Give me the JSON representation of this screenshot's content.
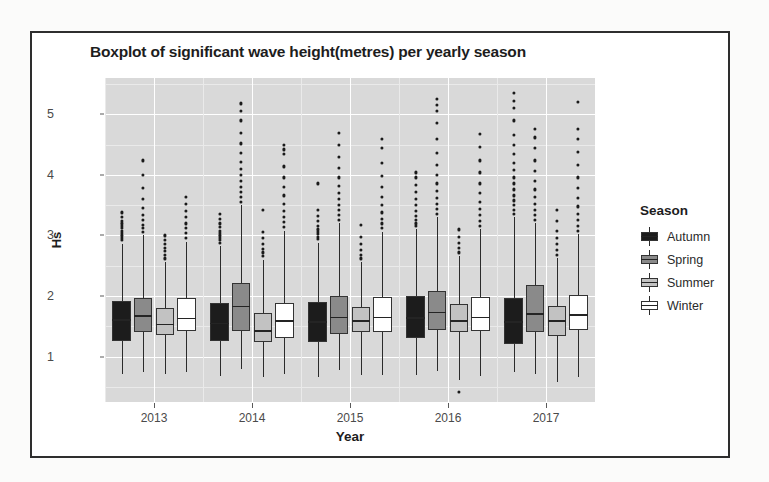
{
  "chart_data": {
    "type": "box",
    "title": "Boxplot of significant wave height(metres) per yearly season",
    "xlabel": "Year",
    "ylabel": "Hs",
    "categories": [
      "2013",
      "2014",
      "2015",
      "2016",
      "2017"
    ],
    "ylim": [
      0.25,
      5.6
    ],
    "yticks": [
      1,
      2,
      3,
      4,
      5
    ],
    "ytick_labels": [
      "1",
      "2",
      "3",
      "4",
      "5"
    ],
    "grid": true,
    "legend": {
      "title": "Season",
      "position": "right",
      "entries": [
        {
          "label": "Autumn",
          "color": "#1c1c1c"
        },
        {
          "label": "Spring",
          "color": "#8a8a8a"
        },
        {
          "label": "Summer",
          "color": "#c2c2c2"
        },
        {
          "label": "Winter",
          "color": "#ffffff"
        }
      ]
    },
    "series": [
      {
        "name": "Autumn",
        "color": "#1c1c1c",
        "boxes": [
          {
            "category": "2013",
            "lower_whisker": 0.72,
            "q1": 1.25,
            "median": 1.62,
            "q3": 1.92,
            "upper_whisker": 2.86,
            "outliers": [
              2.92,
              2.96,
              3.0,
              3.04,
              3.08,
              3.12,
              3.16,
              3.2,
              3.24,
              3.3,
              3.38
            ]
          },
          {
            "category": "2014",
            "lower_whisker": 0.68,
            "q1": 1.26,
            "median": 1.56,
            "q3": 1.88,
            "upper_whisker": 2.82,
            "outliers": [
              2.88,
              2.92,
              2.96,
              3.0,
              3.04,
              3.08,
              3.14,
              3.2,
              3.28,
              3.36
            ]
          },
          {
            "category": "2015",
            "lower_whisker": 0.66,
            "q1": 1.24,
            "median": 1.58,
            "q3": 1.9,
            "upper_whisker": 2.88,
            "outliers": [
              2.94,
              2.98,
              3.02,
              3.06,
              3.1,
              3.16,
              3.24,
              3.32,
              3.42,
              3.86
            ]
          },
          {
            "category": "2016",
            "lower_whisker": 0.7,
            "q1": 1.3,
            "median": 1.65,
            "q3": 2.0,
            "upper_whisker": 3.1,
            "outliers": [
              3.16,
              3.2,
              3.26,
              3.32,
              3.4,
              3.5,
              3.6,
              3.72,
              3.84,
              3.96,
              4.04
            ]
          },
          {
            "category": "2017",
            "lower_whisker": 0.74,
            "q1": 1.2,
            "median": 1.58,
            "q3": 1.96,
            "upper_whisker": 3.3,
            "outliers": [
              3.36,
              3.42,
              3.5,
              3.58,
              3.66,
              3.76,
              3.86,
              3.96,
              4.08,
              4.2,
              4.34,
              4.5,
              4.66,
              4.9,
              5.1,
              5.22,
              5.36
            ]
          }
        ]
      },
      {
        "name": "Spring",
        "color": "#8a8a8a",
        "boxes": [
          {
            "category": "2013",
            "lower_whisker": 0.74,
            "q1": 1.4,
            "median": 1.68,
            "q3": 1.96,
            "upper_whisker": 3.0,
            "outliers": [
              3.06,
              3.12,
              3.18,
              3.26,
              3.34,
              3.46,
              3.6,
              3.78,
              4.0,
              4.24
            ]
          },
          {
            "category": "2014",
            "lower_whisker": 0.8,
            "q1": 1.42,
            "median": 1.84,
            "q3": 2.22,
            "upper_whisker": 3.5,
            "outliers": [
              3.56,
              3.64,
              3.72,
              3.8,
              3.9,
              4.0,
              4.1,
              4.22,
              4.36,
              4.52,
              4.7,
              4.9,
              5.06,
              5.18
            ]
          },
          {
            "category": "2015",
            "lower_whisker": 0.78,
            "q1": 1.38,
            "median": 1.66,
            "q3": 2.0,
            "upper_whisker": 3.2,
            "outliers": [
              3.26,
              3.34,
              3.42,
              3.5,
              3.6,
              3.7,
              3.82,
              3.96,
              4.12,
              4.3,
              4.5,
              4.7
            ]
          },
          {
            "category": "2016",
            "lower_whisker": 0.76,
            "q1": 1.44,
            "median": 1.74,
            "q3": 2.08,
            "upper_whisker": 3.3,
            "outliers": [
              3.36,
              3.44,
              3.52,
              3.62,
              3.74,
              3.86,
              4.0,
              4.16,
              4.36,
              4.6,
              4.86,
              5.06,
              5.16,
              5.26
            ]
          },
          {
            "category": "2017",
            "lower_whisker": 0.72,
            "q1": 1.4,
            "median": 1.72,
            "q3": 2.18,
            "upper_whisker": 3.2,
            "outliers": [
              3.26,
              3.34,
              3.42,
              3.52,
              3.64,
              3.76,
              3.9,
              4.06,
              4.24,
              4.44,
              4.62,
              4.76
            ]
          }
        ]
      },
      {
        "name": "Summer",
        "color": "#c2c2c2",
        "boxes": [
          {
            "category": "2013",
            "lower_whisker": 0.72,
            "q1": 1.36,
            "median": 1.54,
            "q3": 1.8,
            "upper_whisker": 2.56,
            "outliers": [
              2.62,
              2.68,
              2.74,
              2.8,
              2.86,
              2.92,
              3.0
            ]
          },
          {
            "category": "2014",
            "lower_whisker": 0.66,
            "q1": 1.24,
            "median": 1.44,
            "q3": 1.72,
            "upper_whisker": 2.6,
            "outliers": [
              2.66,
              2.72,
              2.78,
              2.86,
              2.96,
              3.06,
              3.42
            ]
          },
          {
            "category": "2015",
            "lower_whisker": 0.7,
            "q1": 1.4,
            "median": 1.6,
            "q3": 1.82,
            "upper_whisker": 2.56,
            "outliers": [
              2.62,
              2.68,
              2.76,
              2.86,
              2.98,
              3.18
            ]
          },
          {
            "category": "2016",
            "lower_whisker": 0.62,
            "q1": 1.4,
            "median": 1.6,
            "q3": 1.86,
            "upper_whisker": 2.66,
            "outliers": [
              2.72,
              2.8,
              2.88,
              2.98,
              3.1,
              0.42
            ]
          },
          {
            "category": "2017",
            "lower_whisker": 0.58,
            "q1": 1.34,
            "median": 1.6,
            "q3": 1.84,
            "upper_whisker": 2.62,
            "outliers": [
              2.68,
              2.76,
              2.86,
              2.96,
              3.08,
              3.24,
              3.42
            ]
          }
        ]
      },
      {
        "name": "Winter",
        "color": "#ffffff",
        "boxes": [
          {
            "category": "2013",
            "lower_whisker": 0.74,
            "q1": 1.42,
            "median": 1.64,
            "q3": 1.96,
            "upper_whisker": 2.9,
            "outliers": [
              2.96,
              3.04,
              3.12,
              3.2,
              3.3,
              3.4,
              3.52,
              3.64
            ]
          },
          {
            "category": "2014",
            "lower_whisker": 0.72,
            "q1": 1.3,
            "median": 1.6,
            "q3": 1.88,
            "upper_whisker": 3.08,
            "outliers": [
              3.14,
              3.22,
              3.3,
              3.4,
              3.52,
              3.66,
              3.8,
              3.96,
              4.14,
              4.34,
              4.42,
              4.5
            ]
          },
          {
            "category": "2015",
            "lower_whisker": 0.7,
            "q1": 1.4,
            "median": 1.66,
            "q3": 1.98,
            "upper_whisker": 3.06,
            "outliers": [
              3.12,
              3.2,
              3.28,
              3.38,
              3.5,
              3.64,
              3.8,
              3.98,
              4.2,
              4.44,
              4.6
            ]
          },
          {
            "category": "2016",
            "lower_whisker": 0.68,
            "q1": 1.42,
            "median": 1.66,
            "q3": 1.98,
            "upper_whisker": 3.1,
            "outliers": [
              3.16,
              3.24,
              3.34,
              3.44,
              3.56,
              3.7,
              3.86,
              4.04,
              4.24,
              4.46,
              4.68
            ]
          },
          {
            "category": "2017",
            "lower_whisker": 0.66,
            "q1": 1.44,
            "median": 1.7,
            "q3": 2.02,
            "upper_whisker": 3.02,
            "outliers": [
              3.08,
              3.16,
              3.26,
              3.36,
              3.48,
              3.62,
              3.78,
              3.96,
              4.16,
              4.38,
              4.6,
              4.76,
              5.2
            ]
          }
        ]
      }
    ]
  }
}
